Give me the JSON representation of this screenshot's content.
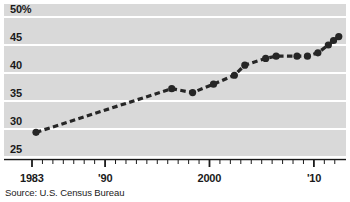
{
  "source_note": "Source: U.S. Census Bureau",
  "axis": {
    "y_ticks": [
      {
        "label": "50%",
        "value": 50
      },
      {
        "label": "45",
        "value": 45
      },
      {
        "label": "40",
        "value": 40
      },
      {
        "label": "35",
        "value": 35
      },
      {
        "label": "30",
        "value": 30
      },
      {
        "label": "25",
        "value": 25
      }
    ],
    "x_ticks": [
      {
        "label": "1983",
        "value": 1983
      },
      {
        "label": "'90",
        "value": 1990
      },
      {
        "label": "2000",
        "value": 2000
      },
      {
        "label": "'10",
        "value": 2010
      }
    ]
  },
  "style": {
    "plot_background": "#d9d9d9",
    "gridline_color": "#ffffff",
    "series_color": "#262626",
    "text_color": "#1a1a1a",
    "page_background": "#ffffff"
  },
  "chart_data": {
    "type": "line",
    "title": "",
    "subtitle": "",
    "xlabel": "",
    "ylabel": "",
    "xlim": [
      1983,
      2012.5
    ],
    "ylim": [
      25,
      50
    ],
    "grid": true,
    "legend": false,
    "line_style": "dashed",
    "marker": "circle",
    "source": "Source: U.S. Census Bureau",
    "x": [
      1983,
      1996,
      1998,
      2000,
      2002,
      2003,
      2005,
      2006,
      2008,
      2009,
      2010,
      2011,
      2011.5,
      2012
    ],
    "y": [
      29.4,
      37.2,
      36.5,
      38.0,
      39.6,
      41.4,
      42.6,
      43.0,
      43.0,
      43.0,
      43.6,
      45.0,
      45.8,
      46.5
    ],
    "series": [
      {
        "name": "Percent",
        "values": [
          29.4,
          37.2,
          36.5,
          38.0,
          39.6,
          41.4,
          42.6,
          43.0,
          43.0,
          43.0,
          43.6,
          45.0,
          45.8,
          46.5
        ]
      }
    ]
  }
}
